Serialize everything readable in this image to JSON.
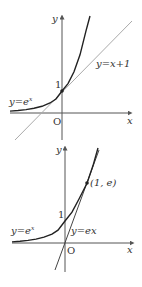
{
  "figures": [
    {
      "id": "top",
      "axis_labels": {
        "x": "x",
        "y": "y",
        "origin": "O"
      },
      "tick_label_y1": "1",
      "curve_label": "y=e",
      "curve_label_sup": "x",
      "line_label": "y=x+1",
      "tangent_point": "(0, 1)"
    },
    {
      "id": "bottom",
      "axis_labels": {
        "x": "x",
        "y": "y",
        "origin": "O"
      },
      "tick_label_y1": "1",
      "curve_label": "y=e",
      "curve_label_sup": "x",
      "line_label": "y=ex",
      "point_label": "(1, e)"
    }
  ],
  "colors": {
    "curve": "#222222",
    "axes": "#555555",
    "tangent_top": "#aaaaaa",
    "tangent_bottom": "#444444"
  }
}
